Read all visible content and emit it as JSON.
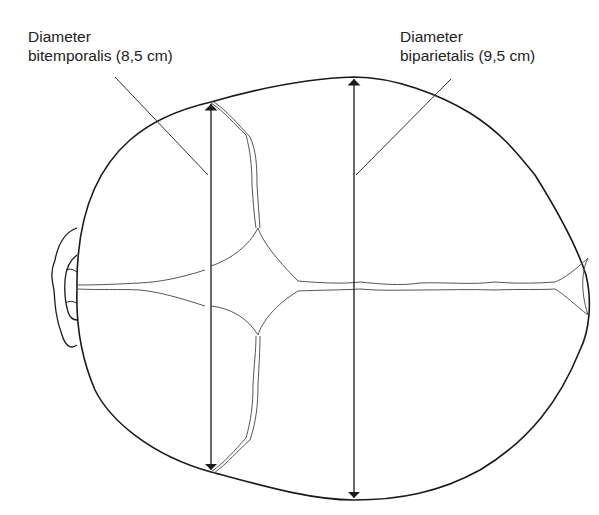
{
  "figure": {
    "labels": {
      "bitemporal": {
        "line1": "Diameter",
        "line2": "bitemporalis (8,5 cm)"
      },
      "biparietal": {
        "line1": "Diameter",
        "line2": "biparietalis (9,5 cm)"
      }
    },
    "colors": {
      "line": "#1a1a1a",
      "suture": "#444444",
      "background": "#ffffff"
    }
  }
}
